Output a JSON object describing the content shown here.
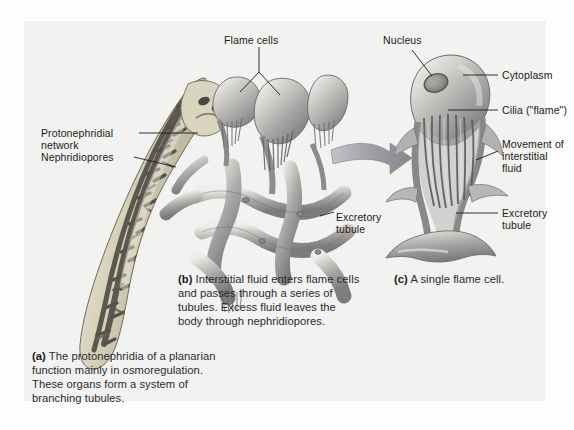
{
  "figure": {
    "title": "Protonephridia of a planarian",
    "background_color": "#f2f2f0",
    "page_color": "#fdfdfd",
    "label_color": "#1b1b1b",
    "caption_color": "#2a2a33",
    "arrow_color": "#8f9196"
  },
  "labels": {
    "flame_cells": "Flame cells",
    "protonephridial_network_line1": "Protonephridial",
    "protonephridial_network_line2": "network",
    "nephridiopores": "Nephridiopores",
    "excretory_tubule_b_line1": "Excretory",
    "excretory_tubule_b_line2": "tubule",
    "nucleus": "Nucleus",
    "cytoplasm": "Cytoplasm",
    "cilia_flame": "Cilia (\"flame\")",
    "movement_line1": "Movement of",
    "movement_line2": "interstitial",
    "movement_line3": "fluid",
    "excretory_tubule_c_line1": "Excretory",
    "excretory_tubule_c_line2": "tubule"
  },
  "captions": {
    "a_marker": "(a)",
    "a_line1": " The protonephridia of a planarian",
    "a_line2": "function mainly in osmoregulation.",
    "a_line3": "These organs form a system of",
    "a_line4": "branching tubules.",
    "b_marker": "(b)",
    "b_line1": " Interstitial fluid enters flame cells",
    "b_line2": "and passes through a series of",
    "b_line3": "tubules. Excess fluid leaves the",
    "b_line4": "body through nephridiopores.",
    "c_marker": "(c)",
    "c_line1": " A single flame cell."
  }
}
